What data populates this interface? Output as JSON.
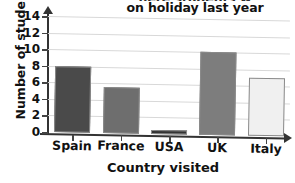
{
  "chart_data": {
    "type": "bar",
    "title": "on holiday last year",
    "title_line_1_clipped": "here students w",
    "xlabel": "Country visited",
    "ylabel": "Number of students",
    "categories": [
      "Spain",
      "France",
      "USA",
      "UK",
      "Italy"
    ],
    "values": [
      8,
      5.5,
      0.5,
      10,
      7
    ],
    "bar_colors": [
      "#4a4a4a",
      "#6e6e6e",
      "#333333",
      "#7d7d7d",
      "#f0f0f0"
    ],
    "bar_border_color": "#8a8a8a",
    "ylim": [
      0,
      14
    ],
    "ytick_step": 2,
    "yticks": [
      "0",
      "2",
      "4",
      "6",
      "8",
      "10",
      "12",
      "14"
    ],
    "grid": true,
    "legend": "none",
    "axis_color": "#333333"
  }
}
